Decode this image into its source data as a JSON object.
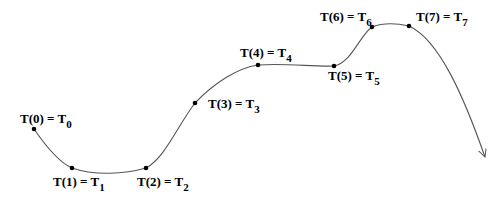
{
  "diagram": {
    "type": "spline-curve",
    "stroke_color": "#555555",
    "point_color": "#000000",
    "points": [
      {
        "x": 34,
        "y": 129,
        "label": "T(0) = T",
        "sub": "0",
        "lx": 20,
        "ly": 123
      },
      {
        "x": 72,
        "y": 168,
        "label": "T(1) = T",
        "sub": "1",
        "lx": 53,
        "ly": 186
      },
      {
        "x": 146,
        "y": 168,
        "label": "T(2) = T",
        "sub": "2",
        "lx": 137,
        "ly": 186
      },
      {
        "x": 195,
        "y": 103,
        "label": "T(3) = T",
        "sub": "3",
        "lx": 208,
        "ly": 108
      },
      {
        "x": 258,
        "y": 65,
        "label": "T(4) = T",
        "sub": "4",
        "lx": 240,
        "ly": 57
      },
      {
        "x": 334,
        "y": 66,
        "label": "T(5) = T",
        "sub": "5",
        "lx": 328,
        "ly": 80
      },
      {
        "x": 372,
        "y": 27,
        "label": "T(6) = T",
        "sub": "6",
        "lx": 320,
        "ly": 21
      },
      {
        "x": 409,
        "y": 26,
        "label": "T(7) = T",
        "sub": "7",
        "lx": 416,
        "ly": 21
      }
    ],
    "arrow_end": {
      "x": 485,
      "y": 157
    }
  }
}
